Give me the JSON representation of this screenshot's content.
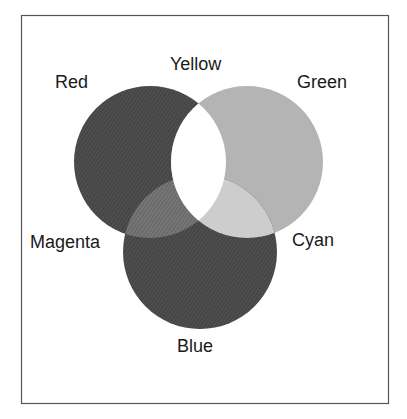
{
  "diagram": {
    "frame": {
      "x": 21,
      "y": 15,
      "width": 367,
      "height": 388,
      "stroke": "#555555"
    },
    "circles": [
      {
        "id": "red",
        "label": "Red",
        "cx": 150,
        "cy": 162,
        "r": 76,
        "fill": "#4a4a4a",
        "hatched": true
      },
      {
        "id": "green",
        "label": "Green",
        "cx": 247,
        "cy": 162,
        "r": 76,
        "fill": "#b4b4b4",
        "hatched": false
      },
      {
        "id": "blue",
        "label": "Blue",
        "cx": 200,
        "cy": 252,
        "r": 77,
        "fill": "#4e4e4e",
        "hatched": true
      }
    ],
    "overlaps": [
      {
        "id": "yellow",
        "label": "Yellow",
        "sets": [
          "red",
          "green"
        ],
        "fill": "#ffffff"
      },
      {
        "id": "magenta",
        "label": "Magenta",
        "sets": [
          "red",
          "blue"
        ],
        "fill": "#6e6e6e",
        "hatched": true
      },
      {
        "id": "cyan",
        "label": "Cyan",
        "sets": [
          "green",
          "blue"
        ],
        "fill": "#cdcdcd"
      },
      {
        "id": "white",
        "label": "",
        "sets": [
          "red",
          "green",
          "blue"
        ],
        "fill": "#ffffff"
      }
    ],
    "labels": {
      "red": "Red",
      "yellow": "Yellow",
      "green": "Green",
      "magenta": "Magenta",
      "cyan": "Cyan",
      "blue": "Blue"
    },
    "colors": {
      "background": "#ffffff",
      "text": "#1a1a1a",
      "hatch_line": "#3a3a3a"
    }
  }
}
